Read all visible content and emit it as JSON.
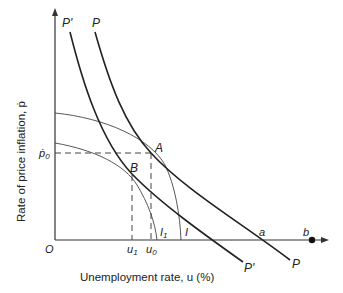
{
  "diagram": {
    "type": "economics-phillips-curve",
    "y_axis_label": "Rate of price inflation, ṗ",
    "x_axis_label": "Unemployment rate, u (%)",
    "origin_label": "O",
    "curves": {
      "P": "P",
      "P_prime": "P'",
      "I": "I",
      "I1": "I",
      "I1_sub": "1"
    },
    "points": {
      "A": "A",
      "B": "B",
      "a": "a",
      "b": "b"
    },
    "ticks": {
      "p0": "ṗ",
      "p0_sub": "0",
      "u1": "u",
      "u1_sub": "1",
      "u0": "u",
      "u0_sub": "0"
    },
    "colors": {
      "ink": "#222222",
      "background": "#ffffff"
    }
  }
}
